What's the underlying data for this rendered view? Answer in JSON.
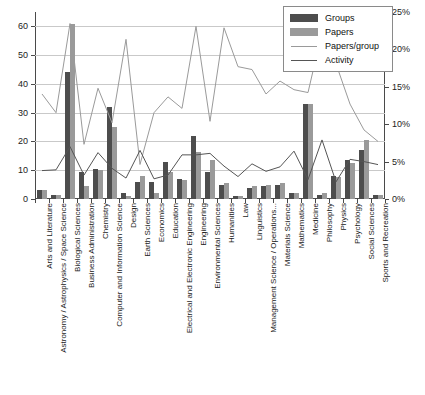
{
  "chart_data": {
    "type": "bar",
    "title": "",
    "subtitle": "",
    "xlabel": "",
    "ylabel": "",
    "ylabel_right": "",
    "grid": true,
    "legend_position": "top-right",
    "ylim": [
      0,
      65
    ],
    "yticks": [
      0,
      10,
      20,
      30,
      40,
      50,
      60
    ],
    "ytick_labels": [
      "0",
      "10",
      "20",
      "30",
      "40",
      "50",
      "60"
    ],
    "ylim_right": [
      0,
      25
    ],
    "yticks_right": [
      0,
      5,
      10,
      15,
      20,
      25
    ],
    "ytick_labels_right": [
      "0%",
      "5%",
      "10%",
      "15%",
      "20%",
      "25%"
    ],
    "categories": [
      "Arts and Literature",
      "Astronomy / Astrophysics / Space Science",
      "Biological Sciences",
      "Business Administration",
      "Chemistry",
      "Computer and Information Science",
      "Design",
      "Earth Sciences",
      "Economics",
      "Education",
      "Electrical and Electronic Engineering",
      "Engineering",
      "Environmental Sciences",
      "Humanities",
      "Law",
      "Linguistics",
      "Management Science / Operations...",
      "Materials Science",
      "Mathematics",
      "Medicine",
      "Philosophy",
      "Physics",
      "Psychology",
      "Social Sciences",
      "Sports and Recreation"
    ],
    "series": [
      {
        "name": "Groups",
        "axis": "left",
        "kind": "bar",
        "color": "#4d4d4d",
        "values": [
          3,
          1.5,
          44,
          9.5,
          10.5,
          32,
          2,
          6,
          6,
          13,
          7,
          22,
          9.5,
          5,
          1,
          4,
          4.5,
          5,
          2,
          33,
          1.5,
          8,
          13.5,
          17,
          1.5
        ]
      },
      {
        "name": "Papers",
        "axis": "left",
        "kind": "bar",
        "color": "#9a9a9a",
        "values": [
          3,
          1.5,
          61,
          4.5,
          10,
          25,
          1,
          8,
          2,
          9.5,
          6.5,
          16.5,
          13.5,
          5.5,
          1,
          4.5,
          5,
          5.5,
          2,
          33,
          2,
          7.5,
          12.5,
          20.5,
          1.5
        ]
      },
      {
        "name": "Papers/group",
        "axis": "left_scaled",
        "kind": "line",
        "color": "#9a9a9a",
        "values": [
          36.5,
          30,
          61,
          19,
          38.5,
          26.5,
          55.5,
          12,
          30,
          35.5,
          31.5,
          60,
          27,
          59.5,
          46,
          45,
          36.5,
          41,
          38,
          37,
          58,
          47,
          33,
          24,
          20
        ]
      },
      {
        "name": "Activity",
        "axis": "right",
        "kind": "line",
        "color": "#555555",
        "values": [
          3.8,
          3.9,
          7.0,
          3.2,
          6.2,
          4.1,
          2.8,
          6.5,
          2.7,
          3.2,
          5.9,
          5.9,
          6.1,
          4.4,
          3.0,
          4.7,
          3.7,
          4.3,
          6.4,
          2.6,
          7.9,
          2.3,
          5.3,
          5.0,
          4.6
        ]
      }
    ],
    "notes": {
      "papers_per_group_display": "plotted on the left 0-65 scale as drawn"
    }
  },
  "legend": {
    "items": [
      {
        "label": "Groups",
        "key": "swatch-dark",
        "color": "#4d4d4d"
      },
      {
        "label": "Papers",
        "key": "swatch-light",
        "color": "#9a9a9a"
      },
      {
        "label": "Papers/group",
        "key": "line-light",
        "color": "#9a9a9a"
      },
      {
        "label": "Activity",
        "key": "line-dark",
        "color": "#555555"
      }
    ]
  }
}
